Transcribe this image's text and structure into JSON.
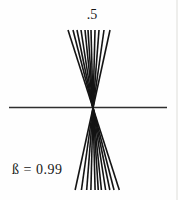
{
  "labels": {
    "top": ".5",
    "beta": "ß = 0.99"
  },
  "figure": {
    "background": "#fefefe",
    "line_color": "#141414",
    "axis_color": "#2e2e2e",
    "center": {
      "x": 93,
      "y": 108
    },
    "fan": {
      "top_y": 30,
      "bottom_y": 190,
      "top_x_offsets": [
        -25,
        -20,
        -16,
        -12,
        -8,
        -5,
        -2,
        2,
        6,
        11,
        17
      ],
      "stroke_width": 1.6
    },
    "axis": {
      "x1": 9,
      "x2": 167,
      "y": 107.5,
      "stroke_width": 1.3
    }
  }
}
